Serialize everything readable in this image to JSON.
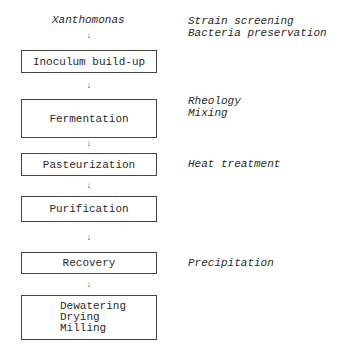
{
  "diagram": {
    "start_label": "Xanthomonas",
    "arrow_glyph": "↓",
    "steps": [
      {
        "label": "Inoculum build-up",
        "lines": [
          "Inoculum build-up"
        ]
      },
      {
        "label": "Fermentation",
        "lines": [
          "Fermentation"
        ]
      },
      {
        "label": "Pasteurization",
        "lines": [
          "Pasteurization"
        ]
      },
      {
        "label": "Purification",
        "lines": [
          "Purification"
        ]
      },
      {
        "label": "Recovery",
        "lines": [
          "Recovery"
        ]
      },
      {
        "label": "Dewatering / Drying / Milling",
        "lines": [
          "Dewatering",
          "Drying",
          "Milling"
        ]
      }
    ],
    "notes": {
      "start": [
        "Strain screening",
        "Bacteria preservation"
      ],
      "fermentation": [
        "Rheology",
        "Mixing"
      ],
      "pasteurization": [
        "Heat treatment"
      ],
      "recovery": [
        "Precipitation"
      ]
    }
  }
}
